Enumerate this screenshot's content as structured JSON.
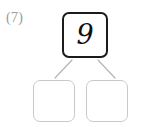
{
  "page": {
    "background_color": "#ffffff",
    "width": 149,
    "height": 127
  },
  "problem": {
    "number_label": "(7)",
    "type": "number-bond",
    "label_color": "#9a9a9a"
  },
  "diagram": {
    "whole": {
      "value": "9",
      "filled": true,
      "border_color": "#1b1b1b",
      "text_color": "#111111"
    },
    "parts": [
      {
        "position": "left",
        "value": "",
        "filled": false,
        "border_color": "#c9c9c9"
      },
      {
        "position": "right",
        "value": "",
        "filled": false,
        "border_color": "#c9c9c9"
      }
    ],
    "connectors": [
      {
        "name": "whole-to-left-part",
        "color": "#b5b5b5"
      },
      {
        "name": "whole-to-right-part",
        "color": "#b5b5b5"
      }
    ]
  }
}
